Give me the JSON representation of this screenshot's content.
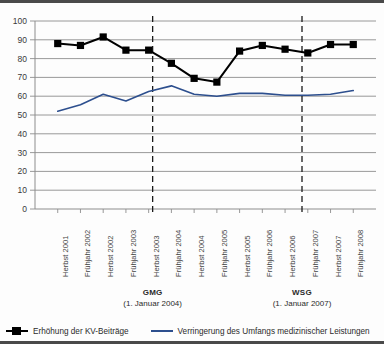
{
  "chart_data": {
    "type": "line",
    "title": "",
    "xlabel": "",
    "ylabel": "",
    "ylim": [
      0,
      100
    ],
    "ytick_step": 10,
    "yticks": [
      "100",
      "90",
      "80",
      "70",
      "60",
      "50",
      "40",
      "30",
      "20",
      "10",
      "0"
    ],
    "grid": true,
    "legend_position": "bottom",
    "categories": [
      "Herbst 2001",
      "Frühjahr 2002",
      "Herbst 2002",
      "Frühjahr 2003",
      "Herbst 2003",
      "Frühjahr 2004",
      "Herbst 2004",
      "Frühjahr 2005",
      "Herbst 2005",
      "Frühjahr 2006",
      "Herbst 2006",
      "Frühjahr 2007",
      "Herbst 2007",
      "Frühjahr 2008"
    ],
    "series": [
      {
        "name": "Erhöhung der KV-Beiträge",
        "color": "#000000",
        "marker": "square",
        "values": [
          88,
          87,
          91.5,
          84.5,
          84.5,
          77.5,
          69.5,
          67.5,
          84,
          87,
          85,
          83,
          87.5,
          87.5
        ]
      },
      {
        "name": "Verringerung des Umfangs medizinischer Leistungen",
        "color": "#2d4f8e",
        "marker": "none",
        "values": [
          52,
          55.5,
          61,
          57.5,
          62.5,
          65.5,
          61,
          60,
          61.5,
          61.5,
          60.5,
          60.5,
          61,
          63
        ]
      }
    ],
    "annotations": [
      {
        "name": "GMG",
        "title": "GMG",
        "subtitle": "(1. Januar 2004)",
        "at_category": "Herbst 2003",
        "line_style": "dashed"
      },
      {
        "name": "WSG",
        "title": "WSG",
        "subtitle": "(1. Januar 2007)",
        "at_category": "Herbst 2006",
        "line_style": "dashed"
      }
    ]
  },
  "legend": {
    "items": [
      {
        "label": "Erhöhung der KV-Beiträge",
        "color": "#000000"
      },
      {
        "label": "Verringerung des Umfangs medizinischer Leistungen",
        "color": "#2d4f8e"
      }
    ]
  },
  "axis": {
    "y_labels": [
      "100",
      "90",
      "80",
      "70",
      "60",
      "50",
      "40",
      "30",
      "20",
      "10",
      "0"
    ],
    "x_labels": [
      "Herbst 2001",
      "Frühjahr 2002",
      "Herbst 2002",
      "Frühjahr 2003",
      "Herbst 2003",
      "Frühjahr 2004",
      "Herbst 2004",
      "Frühjahr 2005",
      "Herbst 2005",
      "Frühjahr 2006",
      "Herbst 2006",
      "Frühjahr 2007",
      "Herbst 2007",
      "Frühjahr 2008"
    ]
  },
  "markers": {
    "gmg": {
      "title": "GMG",
      "subtitle": "(1. Januar 2004)"
    },
    "wsg": {
      "title": "WSG",
      "subtitle": "(1. Januar 2007)"
    }
  }
}
